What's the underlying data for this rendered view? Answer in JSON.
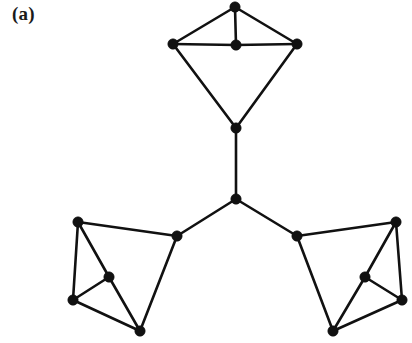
{
  "figure": {
    "panel_label": "(a)",
    "title": "",
    "background_color": "#ffffff",
    "node_color": "#111111",
    "edge_color": "#111111",
    "width": 412,
    "height": 343
  },
  "chart_data": {
    "type": "diagram",
    "subtype": "node-link-graph",
    "title": "(a)",
    "xlabel": "",
    "ylabel": "",
    "grid": false,
    "legend": false,
    "directed": false,
    "node_count": 14,
    "edge_count": 22,
    "node_radius": 5.2,
    "edge_width": 2.6,
    "nodes": [
      {
        "id": "t_apex",
        "x": 235,
        "y": 7,
        "group": "top-cluster"
      },
      {
        "id": "t_left",
        "x": 173,
        "y": 44,
        "group": "top-cluster"
      },
      {
        "id": "t_center",
        "x": 236,
        "y": 45,
        "group": "top-cluster"
      },
      {
        "id": "t_right",
        "x": 297,
        "y": 44,
        "group": "top-cluster"
      },
      {
        "id": "t_bottom",
        "x": 236,
        "y": 128,
        "group": "top-cluster"
      },
      {
        "id": "hub",
        "x": 236,
        "y": 199,
        "group": "center"
      },
      {
        "id": "bl_link",
        "x": 177,
        "y": 236,
        "group": "bottom-left-cluster"
      },
      {
        "id": "bl_top",
        "x": 78,
        "y": 222,
        "group": "bottom-left-cluster"
      },
      {
        "id": "bl_mid",
        "x": 109,
        "y": 277,
        "group": "bottom-left-cluster"
      },
      {
        "id": "bl_left",
        "x": 73,
        "y": 300,
        "group": "bottom-left-cluster"
      },
      {
        "id": "bl_bot",
        "x": 140,
        "y": 331,
        "group": "bottom-left-cluster"
      },
      {
        "id": "br_link",
        "x": 297,
        "y": 236,
        "group": "bottom-right-cluster"
      },
      {
        "id": "br_top",
        "x": 396,
        "y": 222,
        "group": "bottom-right-cluster"
      },
      {
        "id": "br_mid",
        "x": 365,
        "y": 277,
        "group": "bottom-right-cluster"
      },
      {
        "id": "br_right",
        "x": 402,
        "y": 300,
        "group": "bottom-right-cluster"
      },
      {
        "id": "br_bot",
        "x": 333,
        "y": 331,
        "group": "bottom-right-cluster"
      }
    ],
    "edges": [
      {
        "source": "t_apex",
        "target": "t_left"
      },
      {
        "source": "t_apex",
        "target": "t_center"
      },
      {
        "source": "t_apex",
        "target": "t_right"
      },
      {
        "source": "t_left",
        "target": "t_center"
      },
      {
        "source": "t_center",
        "target": "t_right"
      },
      {
        "source": "t_left",
        "target": "t_bottom"
      },
      {
        "source": "t_right",
        "target": "t_bottom"
      },
      {
        "source": "t_bottom",
        "target": "hub"
      },
      {
        "source": "hub",
        "target": "bl_link"
      },
      {
        "source": "hub",
        "target": "br_link"
      },
      {
        "source": "bl_link",
        "target": "bl_top"
      },
      {
        "source": "bl_link",
        "target": "bl_bot"
      },
      {
        "source": "bl_top",
        "target": "bl_left"
      },
      {
        "source": "bl_top",
        "target": "bl_mid"
      },
      {
        "source": "bl_mid",
        "target": "bl_left"
      },
      {
        "source": "bl_mid",
        "target": "bl_bot"
      },
      {
        "source": "bl_left",
        "target": "bl_bot"
      },
      {
        "source": "br_link",
        "target": "br_top"
      },
      {
        "source": "br_link",
        "target": "br_bot"
      },
      {
        "source": "br_top",
        "target": "br_right"
      },
      {
        "source": "br_top",
        "target": "br_mid"
      },
      {
        "source": "br_mid",
        "target": "br_right"
      },
      {
        "source": "br_mid",
        "target": "br_bot"
      },
      {
        "source": "br_right",
        "target": "br_bot"
      }
    ]
  }
}
